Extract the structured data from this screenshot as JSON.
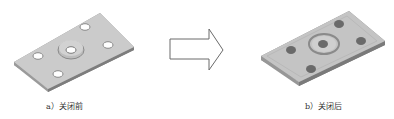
{
  "figure": {
    "panels": [
      {
        "id": "a",
        "caption": "a）关闭前",
        "description": "plate with five open holes and raised center boss (before closing)"
      },
      {
        "id": "b",
        "caption": "b）关闭后",
        "description": "plate with holes closed/filled (after closing)"
      }
    ],
    "arrow": {
      "direction": "right",
      "icon": "arrow-right-outline-icon"
    }
  },
  "colors": {
    "plate_top": "#c9c9c9",
    "plate_edge": "#9a9a9a",
    "hole_dark": "#6a6a6a",
    "caption_text": "#333333"
  }
}
